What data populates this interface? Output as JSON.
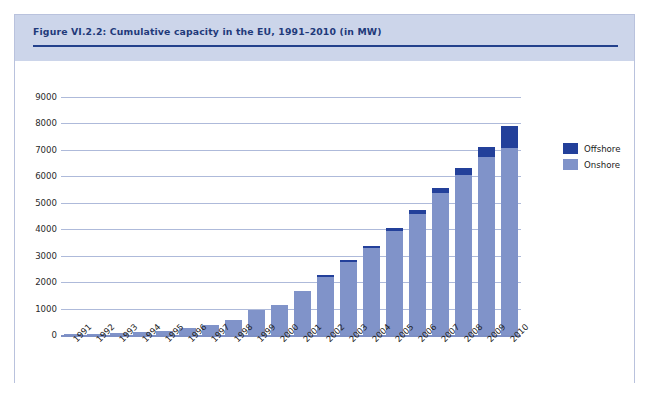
{
  "figure": {
    "title": "Figure VI.2.2: Cumulative capacity in the EU, 1991–2010 (in MW)",
    "source": "Source: EWEA (2008a)"
  },
  "legend": {
    "position": "right",
    "entries": [
      {
        "label": "Offshore",
        "color": "#23409a"
      },
      {
        "label": "Onshore",
        "color": "#8093c9"
      }
    ]
  },
  "colors": {
    "header_band": "#ccd5ea",
    "title_text": "#1f3a7a",
    "title_rule": "#23418c",
    "gridline": "#aebada",
    "baseline": "#7d8fc4",
    "frame_border": "#b9c2dd",
    "offshore": "#23409a",
    "onshore": "#8093c9"
  },
  "chart_data": {
    "type": "bar",
    "title": "Figure VI.2.2: Cumulative capacity in the EU, 1991–2010 (in MW)",
    "xlabel": "",
    "ylabel": "",
    "ylim": [
      0,
      9000
    ],
    "ytick_step": 1000,
    "yticks": [
      0,
      1000,
      2000,
      3000,
      4000,
      5000,
      6000,
      7000,
      8000,
      9000
    ],
    "ytick_labels": [
      "0",
      "1000",
      "2000",
      "3000",
      "4000",
      "5000",
      "6000",
      "7000",
      "8000",
      "9000"
    ],
    "grid": true,
    "stacked": true,
    "categories": [
      "1991",
      "1992",
      "1993",
      "1994",
      "1995",
      "1996",
      "1997",
      "1998",
      "1999",
      "2000",
      "2001",
      "2002",
      "2003",
      "2004",
      "2005",
      "2006",
      "2007",
      "2008",
      "2009",
      "2010"
    ],
    "series": [
      {
        "name": "Onshore",
        "color": "#8093c9",
        "values": [
          40,
          55,
          75,
          110,
          160,
          250,
          370,
          560,
          950,
          1150,
          1650,
          2200,
          2750,
          3280,
          3930,
          4580,
          5360,
          6050,
          6720,
          7080
        ]
      },
      {
        "name": "Offshore",
        "color": "#23409a",
        "values": [
          0,
          0,
          0,
          0,
          0,
          0,
          0,
          0,
          0,
          0,
          0,
          30,
          60,
          90,
          120,
          160,
          210,
          260,
          380,
          840
        ]
      }
    ],
    "totals": [
      40,
      55,
      75,
      110,
      160,
      250,
      370,
      560,
      950,
      1150,
      1650,
      2230,
      2810,
      3370,
      4050,
      4740,
      5570,
      6310,
      7100,
      7920
    ]
  }
}
